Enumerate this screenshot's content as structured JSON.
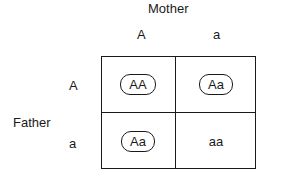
{
  "diagram": {
    "type": "punnett-square",
    "top_parent": {
      "label": "Mother",
      "alleles": [
        "A",
        "a"
      ]
    },
    "side_parent": {
      "label": "Father",
      "alleles": [
        "A",
        "a"
      ]
    },
    "cells": [
      [
        {
          "genotype": "AA",
          "circled": true
        },
        {
          "genotype": "Aa",
          "circled": true
        }
      ],
      [
        {
          "genotype": "Aa",
          "circled": true
        },
        {
          "genotype": "aa",
          "circled": false
        }
      ]
    ],
    "colors": {
      "line": "#1a1a1a",
      "text": "#1a1a1a",
      "background": "#ffffff"
    }
  }
}
